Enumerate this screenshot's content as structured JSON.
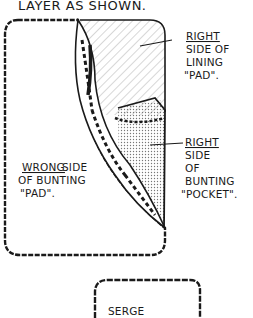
{
  "header": {
    "text": "LAYER AS SHOWN."
  },
  "labels": {
    "lining": {
      "line1": "RIGHT",
      "line2": "SIDE OF",
      "line3": "LINING",
      "line4": "\"PAD\"."
    },
    "pocket": {
      "line1": "RIGHT",
      "line2": "SIDE",
      "line3": "OF",
      "line4": "BUNTING",
      "line5": "\"POCKET\"."
    },
    "wrong": {
      "line1": "WRONG",
      "line1b": "SIDE",
      "line2": "OF BUNTING",
      "line3": "\"PAD\"."
    }
  },
  "bottom_box": {
    "text": "SERGE"
  },
  "colors": {
    "ink": "#1a1a1a",
    "background": "#ffffff"
  }
}
